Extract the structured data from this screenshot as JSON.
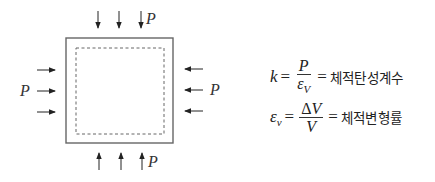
{
  "diagram": {
    "load_label_top": "P",
    "load_label_left": "P",
    "load_label_right": "P",
    "load_label_bottom": "P",
    "outer_square": {
      "x": 66,
      "y": 38,
      "w": 107,
      "h": 105
    },
    "inner_dashed_square": {
      "x": 76,
      "y": 48,
      "w": 88,
      "h": 86
    },
    "arrow_count_per_side": 3,
    "colors": {
      "stroke": "#555555",
      "arrow": "#222222",
      "dashed": "#666666"
    }
  },
  "formulas": {
    "bulk_modulus": {
      "lhs": "k",
      "equals": "=",
      "numerator": "P",
      "denominator": "ε",
      "denominator_sub": "V",
      "equals2": "=",
      "meaning": "체적탄성계수"
    },
    "volumetric_strain": {
      "lhs": "ε",
      "lhs_sub": "v",
      "equals": "=",
      "numerator_delta": "Δ",
      "numerator": "V",
      "denominator": "V",
      "equals2": "=",
      "meaning": "체적변형률"
    }
  }
}
